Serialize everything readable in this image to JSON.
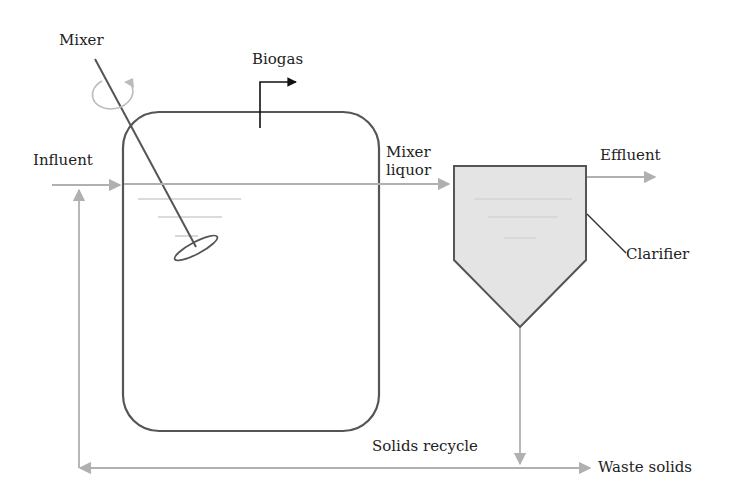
{
  "diagram": {
    "type": "process-flow",
    "title": "",
    "labels": {
      "mixer": "Mixer",
      "biogas": "Biogas",
      "influent": "Influent",
      "mixer_liquor_line1": "Mixer",
      "mixer_liquor_line2": "liquor",
      "effluent": "Effluent",
      "clarifier": "Clarifier",
      "solids_recycle": "Solids recycle",
      "waste_solids": "Waste solids"
    },
    "nodes": [
      {
        "id": "reactor",
        "label": "",
        "shape": "rounded-rectangle"
      },
      {
        "id": "mixer",
        "label": "Mixer",
        "shape": "impeller"
      },
      {
        "id": "clarifier",
        "label": "Clarifier",
        "shape": "hopper"
      }
    ],
    "edges": [
      {
        "from": "influent",
        "to": "reactor",
        "label": "Influent"
      },
      {
        "from": "reactor",
        "to": "biogas",
        "label": "Biogas"
      },
      {
        "from": "reactor",
        "to": "clarifier",
        "label": "Mixer liquor"
      },
      {
        "from": "clarifier",
        "to": "effluent",
        "label": "Effluent"
      },
      {
        "from": "clarifier",
        "to": "reactor",
        "label": "Solids recycle"
      },
      {
        "from": "clarifier",
        "to": "waste",
        "label": "Waste solids"
      }
    ],
    "colors": {
      "outline": "#555555",
      "flow_line": "#b0b0b0",
      "clarifier_fill": "#e4e4e4",
      "biogas_arrow": "#111111",
      "text": "#222222"
    }
  }
}
